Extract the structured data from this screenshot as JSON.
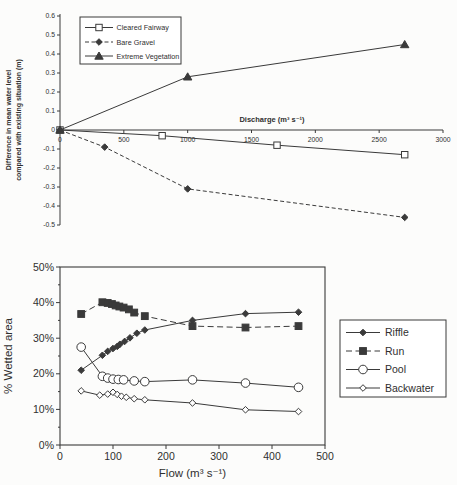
{
  "colors": {
    "ink": "#3a3a3a",
    "paper": "#fcfcfb"
  },
  "chart_data": [
    {
      "id": "water-level",
      "type": "line",
      "title": "",
      "xlabel": "Discharge (m³ s⁻¹)",
      "ylabel": "Difference in mean water level compared with existing situation (m)",
      "ylabel_lines": [
        "Difference in mean water level",
        "compared with existing situation (m)"
      ],
      "xlim": [
        0,
        3000
      ],
      "ylim": [
        -0.5,
        0.6
      ],
      "xticks": [
        0,
        500,
        1000,
        1500,
        2000,
        2500,
        3000
      ],
      "yticks": [
        0.6,
        0.5,
        0.4,
        0.3,
        0.2,
        0.1,
        0,
        -0.1,
        -0.2,
        -0.3,
        -0.4,
        -0.5
      ],
      "grid": false,
      "legend_position": "top-left",
      "series": [
        {
          "name": "Cleared Fairway",
          "line": "solid",
          "marker": "square-open",
          "points": [
            [
              0,
              0
            ],
            [
              800,
              -0.03
            ],
            [
              1700,
              -0.08
            ],
            [
              2700,
              -0.13
            ]
          ]
        },
        {
          "name": "Bare Gravel",
          "line": "dashed",
          "marker": "diamond-filled",
          "points": [
            [
              0,
              0
            ],
            [
              350,
              -0.09
            ],
            [
              1000,
              -0.31
            ],
            [
              2700,
              -0.46
            ]
          ]
        },
        {
          "name": "Extreme Vegetation",
          "line": "solid",
          "marker": "triangle-filled",
          "points": [
            [
              0,
              0
            ],
            [
              1000,
              0.28
            ],
            [
              2700,
              0.45
            ]
          ]
        }
      ]
    },
    {
      "id": "wetted-area",
      "type": "line",
      "title": "",
      "xlabel": "Flow (m³ s⁻¹)",
      "ylabel": "% Wetted area",
      "xlim": [
        0,
        500
      ],
      "ylim": [
        0,
        50
      ],
      "xticks": [
        0,
        100,
        200,
        300,
        400,
        500
      ],
      "yticks": [
        0,
        10,
        20,
        30,
        40,
        50
      ],
      "yticks_minor": [
        5,
        15,
        25,
        35,
        45
      ],
      "ytick_suffix": "%",
      "grid": false,
      "legend_position": "right",
      "series": [
        {
          "name": "Riffle",
          "line": "solid",
          "marker": "diamond-filled",
          "points": [
            [
              40,
              21
            ],
            [
              80,
              25.2
            ],
            [
              90,
              26.3
            ],
            [
              100,
              27.1
            ],
            [
              108,
              27.7
            ],
            [
              113,
              28.3
            ],
            [
              122,
              29.1
            ],
            [
              132,
              30.1
            ],
            [
              145,
              31.4
            ],
            [
              160,
              32.3
            ],
            [
              250,
              35
            ],
            [
              350,
              36.9
            ],
            [
              450,
              37.3
            ]
          ]
        },
        {
          "name": "Run",
          "line": "dashed",
          "marker": "square-filled",
          "points": [
            [
              40,
              36.8
            ],
            [
              80,
              40.1
            ],
            [
              90,
              39.9
            ],
            [
              98,
              39.6
            ],
            [
              105,
              39.2
            ],
            [
              112,
              38.9
            ],
            [
              120,
              38.6
            ],
            [
              130,
              38.1
            ],
            [
              140,
              37.2
            ],
            [
              160,
              36.2
            ],
            [
              250,
              33.4
            ],
            [
              350,
              33
            ],
            [
              450,
              33.4
            ]
          ]
        },
        {
          "name": "Pool",
          "line": "solid",
          "marker": "circle-open",
          "points": [
            [
              40,
              27.5
            ],
            [
              80,
              19.3
            ],
            [
              90,
              18.8
            ],
            [
              100,
              18.5
            ],
            [
              110,
              18.4
            ],
            [
              120,
              18.3
            ],
            [
              140,
              18
            ],
            [
              160,
              17.8
            ],
            [
              250,
              18.3
            ],
            [
              350,
              17.4
            ],
            [
              450,
              16.2
            ]
          ]
        },
        {
          "name": "Backwater",
          "line": "solid",
          "marker": "diamond-open",
          "points": [
            [
              40,
              15.2
            ],
            [
              75,
              14
            ],
            [
              90,
              14.3
            ],
            [
              100,
              14.8
            ],
            [
              108,
              14.2
            ],
            [
              116,
              13.7
            ],
            [
              125,
              13.4
            ],
            [
              140,
              13
            ],
            [
              160,
              12.7
            ],
            [
              250,
              11.8
            ],
            [
              350,
              9.9
            ],
            [
              450,
              9.4
            ]
          ]
        }
      ]
    }
  ]
}
